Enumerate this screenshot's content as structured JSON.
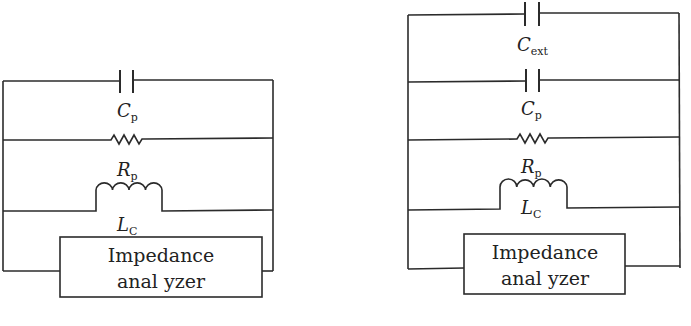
{
  "diagram": {
    "type": "equivalent circuit schematics",
    "colors": {
      "line": "#2b2b2b",
      "text": "#222222",
      "background": "#ffffff"
    },
    "left_circuit": {
      "components": [
        {
          "type": "capacitor",
          "label": "C",
          "subscript": "p"
        },
        {
          "type": "resistor",
          "label": "R",
          "subscript": "p"
        },
        {
          "type": "inductor",
          "label": "L",
          "subscript": "C"
        }
      ],
      "instrument": {
        "line1": "Impedance",
        "line2": "anal yzer"
      }
    },
    "right_circuit": {
      "components": [
        {
          "type": "capacitor",
          "label": "C",
          "subscript": "ext"
        },
        {
          "type": "capacitor",
          "label": "C",
          "subscript": "p"
        },
        {
          "type": "resistor",
          "label": "R",
          "subscript": "p"
        },
        {
          "type": "inductor",
          "label": "L",
          "subscript": "C"
        }
      ],
      "instrument": {
        "line1": "Impedance",
        "line2": "anal yzer"
      }
    }
  }
}
